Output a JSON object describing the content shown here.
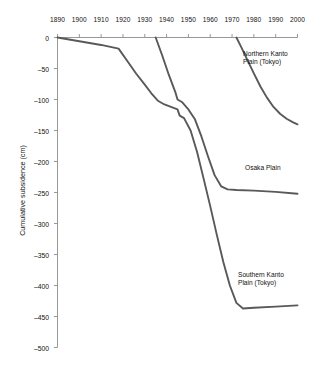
{
  "chart_data": {
    "type": "line",
    "title": "",
    "xlabel": "",
    "ylabel": "Cumulative subsidence (cm)",
    "xlim": [
      1890,
      2000
    ],
    "ylim": [
      -500,
      0
    ],
    "xticks": [
      "1890",
      "1900",
      "1910",
      "1920",
      "1930",
      "1940",
      "1950",
      "1960",
      "1970",
      "1980",
      "1990",
      "2000"
    ],
    "yticks": [
      "0",
      "–50",
      "–100",
      "–150",
      "–200",
      "–250",
      "–300",
      "–350",
      "–400",
      "–450",
      "–500"
    ],
    "grid": false,
    "xaxis_position": "top",
    "legend_position": "inline-right",
    "line_color": "#595959",
    "axis_color": "#8c8c8c",
    "series": [
      {
        "name": "Northern Kanto Plain (Tokyo)",
        "label_lines": [
          "Northern Kanto",
          "Plain (Tokyo)"
        ],
        "x": [
          1972,
          1974,
          1977,
          1980,
          1983,
          1986,
          1989,
          1992,
          1995,
          1998,
          2000
        ],
        "values": [
          0,
          -14,
          -36,
          -58,
          -79,
          -97,
          -112,
          -123,
          -131,
          -137,
          -140
        ]
      },
      {
        "name": "Osaka Plain",
        "label_lines": [
          "Osaka Plain"
        ],
        "x": [
          1935,
          1938,
          1941,
          1944,
          1945,
          1947,
          1950,
          1953,
          1956,
          1959,
          1962,
          1965,
          1968,
          1972,
          1980,
          1990,
          2000
        ],
        "values": [
          0,
          -29,
          -60,
          -88,
          -100,
          -104,
          -116,
          -132,
          -160,
          -192,
          -222,
          -240,
          -245,
          -246,
          -247,
          -249,
          -252
        ]
      },
      {
        "name": "Southern Kanto Plain (Tokyo)",
        "label_lines": [
          "Southern Kanto",
          "Plain (Tokyo)"
        ],
        "x": [
          1890,
          1900,
          1910,
          1918,
          1922,
          1926,
          1930,
          1933,
          1936,
          1939,
          1942,
          1945,
          1946,
          1948,
          1951,
          1954,
          1957,
          1960,
          1963,
          1966,
          1969,
          1972,
          1975,
          1980,
          1990,
          2000
        ],
        "values": [
          0,
          -6,
          -12,
          -18,
          -38,
          -58,
          -76,
          -90,
          -102,
          -108,
          -112,
          -116,
          -126,
          -130,
          -150,
          -185,
          -228,
          -272,
          -318,
          -362,
          -400,
          -428,
          -437,
          -436,
          -434,
          -432
        ]
      }
    ]
  },
  "annotations": {
    "northern_label": "Northern Kanto\nPlain (Tokyo)",
    "osaka_label": "Osaka Plain",
    "southern_label": "Southern Kanto\nPlain (Tokyo)"
  }
}
